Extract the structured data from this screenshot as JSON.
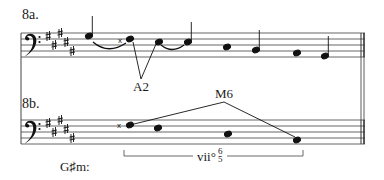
{
  "example_a": {
    "label": "8a.",
    "interval_label": "A2"
  },
  "example_b": {
    "label": "8b.",
    "interval_label": "M6",
    "key_label": "G♯m:",
    "chord_label": "vii°",
    "chord_figure_top": "6",
    "chord_figure_bottom": "5"
  },
  "notation": {
    "clef": "bass",
    "key_signature": "5 sharps",
    "accidental_symbol": "x"
  }
}
